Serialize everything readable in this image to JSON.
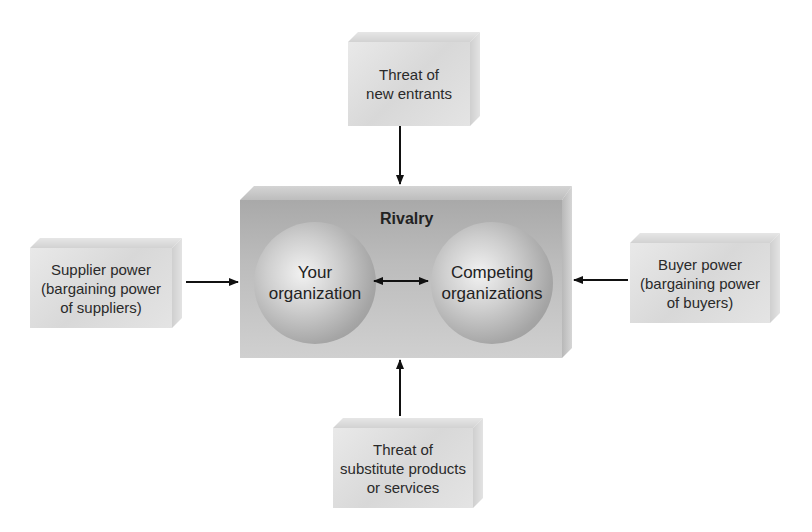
{
  "diagram": {
    "center": {
      "label": "Rivalry",
      "nodes": [
        {
          "id": "your-org",
          "line1": "Your",
          "line2": "organization"
        },
        {
          "id": "competing-orgs",
          "line1": "Competing",
          "line2": "organizations"
        }
      ],
      "connection": "bidirectional"
    },
    "forces": {
      "top": {
        "line1": "Threat of",
        "line2": "new entrants",
        "line3": ""
      },
      "left": {
        "line1": "Supplier power",
        "line2": "(bargaining power",
        "line3": "of suppliers)"
      },
      "right": {
        "line1": "Buyer power",
        "line2": "(bargaining power",
        "line3": "of buyers)"
      },
      "bottom": {
        "line1": "Threat of",
        "line2": "substitute products",
        "line3": "or services"
      }
    },
    "arrows": [
      {
        "from": "top",
        "to": "center"
      },
      {
        "from": "left",
        "to": "center"
      },
      {
        "from": "right",
        "to": "center"
      },
      {
        "from": "bottom",
        "to": "center"
      },
      {
        "from": "your-org",
        "to": "competing-orgs",
        "bidirectional": true
      }
    ],
    "colors": {
      "box_face": "#dcdcdc",
      "center_face": "#b5b5b5",
      "sphere": "#b0b0b0",
      "arrow": "#111111"
    }
  }
}
